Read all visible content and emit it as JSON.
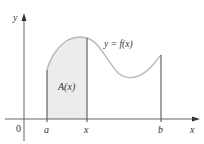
{
  "diagram": {
    "title": "",
    "axes": {
      "x_label": "x",
      "y_label": "y",
      "origin_label": "0"
    },
    "curve_label": "y = f(x)",
    "area_label": "A(x)",
    "ticks": [
      {
        "id": "a",
        "label": "a"
      },
      {
        "id": "x",
        "label": "x"
      },
      {
        "id": "b",
        "label": "b"
      }
    ],
    "colors": {
      "axis": "#555555",
      "curve": "#b8b8b8",
      "shade": "#ececec",
      "vertical_lines": "#333333",
      "text": "#333333"
    }
  }
}
